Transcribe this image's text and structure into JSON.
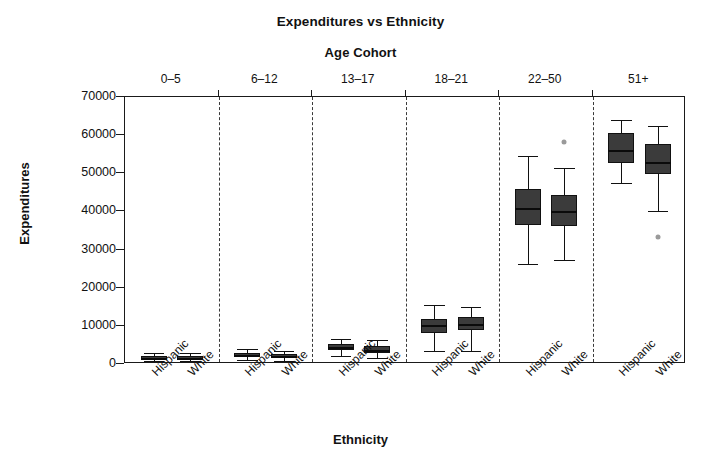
{
  "chart_data": {
    "type": "box",
    "title": "Expenditures vs Ethnicity",
    "strip_title": "Age Cohort",
    "xlabel": "Ethnicity",
    "ylabel": "Expenditures",
    "ylim": [
      0,
      70000
    ],
    "ytick_labels": [
      "0",
      "10000",
      "20000",
      "30000",
      "40000",
      "50000",
      "60000",
      "70000"
    ],
    "ytick_values": [
      0,
      10000,
      20000,
      30000,
      40000,
      50000,
      60000,
      70000
    ],
    "grid": false,
    "legend": "none",
    "panels": [
      "0–5",
      "6–12",
      "13–17",
      "18–21",
      "22–50",
      "51+"
    ],
    "groups": [
      "Hispanic",
      "White"
    ],
    "xtick_labels": [
      "Hispanic",
      "White",
      "Hispanic",
      "White",
      "Hispanic",
      "White",
      "Hispanic",
      "White",
      "Hispanic",
      "White",
      "Hispanic",
      "White"
    ],
    "boxes": [
      {
        "panel": "0–5",
        "group": "Hispanic",
        "whisker_low": 700,
        "q1": 1200,
        "median": 1600,
        "q3": 2100,
        "whisker_high": 2800,
        "outliers": []
      },
      {
        "panel": "0–5",
        "group": "White",
        "whisker_low": 700,
        "q1": 1100,
        "median": 1500,
        "q3": 2200,
        "whisker_high": 2900,
        "outliers": []
      },
      {
        "panel": "6–12",
        "group": "Hispanic",
        "whisker_low": 1100,
        "q1": 1900,
        "median": 2400,
        "q3": 3000,
        "whisker_high": 3900,
        "outliers": []
      },
      {
        "panel": "6–12",
        "group": "White",
        "whisker_low": 900,
        "q1": 1500,
        "median": 2000,
        "q3": 2600,
        "whisker_high": 3400,
        "outliers": []
      },
      {
        "panel": "13–17",
        "group": "Hispanic",
        "whisker_low": 2000,
        "q1": 3600,
        "median": 4400,
        "q3": 5200,
        "whisker_high": 6500,
        "outliers": []
      },
      {
        "panel": "13–17",
        "group": "White",
        "whisker_low": 1600,
        "q1": 3000,
        "median": 3800,
        "q3": 4700,
        "whisker_high": 6200,
        "outliers": []
      },
      {
        "panel": "18–21",
        "group": "Hispanic",
        "whisker_low": 3300,
        "q1": 8200,
        "median": 10200,
        "q3": 11900,
        "whisker_high": 15500,
        "outliers": []
      },
      {
        "panel": "18–21",
        "group": "White",
        "whisker_low": 3500,
        "q1": 8800,
        "median": 10600,
        "q3": 12300,
        "whisker_high": 14900,
        "outliers": []
      },
      {
        "panel": "22–50",
        "group": "Hispanic",
        "whisker_low": 26200,
        "q1": 36500,
        "median": 40800,
        "q3": 45800,
        "whisker_high": 54600,
        "outliers": []
      },
      {
        "panel": "22–50",
        "group": "White",
        "whisker_low": 27300,
        "q1": 36200,
        "median": 40200,
        "q3": 44200,
        "whisker_high": 51300,
        "outliers": [
          58300
        ]
      },
      {
        "panel": "51+",
        "group": "Hispanic",
        "whisker_low": 47500,
        "q1": 52600,
        "median": 56200,
        "q3": 60500,
        "whisker_high": 64000,
        "outliers": []
      },
      {
        "panel": "51+",
        "group": "White",
        "whisker_low": 40200,
        "q1": 49700,
        "median": 53000,
        "q3": 57800,
        "whisker_high": 62300,
        "outliers": [
          33400
        ]
      }
    ],
    "colors": {
      "box_fill": "#3b3b3b",
      "box_edge": "#111111",
      "median": "#0b0b0b",
      "outlier": "#9a9a9a",
      "axis": "#1a1a1a",
      "background": "#ffffff"
    }
  }
}
